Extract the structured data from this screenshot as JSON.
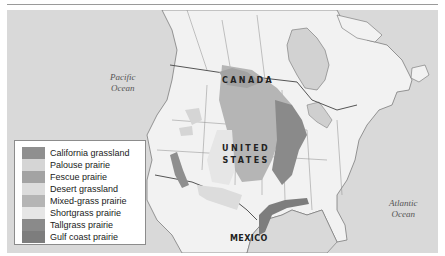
{
  "map": {
    "labels": {
      "pacific": [
        "Pacific",
        "Ocean"
      ],
      "atlantic": [
        "Atlantic",
        "Ocean"
      ],
      "canada": "CANADA",
      "united_states": [
        "UNITED",
        "STATES"
      ],
      "mexico": "MEXICO"
    },
    "colors": {
      "ocean": "#d9d9d9",
      "land": "#f2f2f2",
      "border": "#6e6e6e",
      "lake": "#cfcfcf"
    }
  },
  "legend": {
    "items": [
      {
        "label": "California grassland",
        "color": "#8f8f8f"
      },
      {
        "label": "Palouse prairie",
        "color": "#d5d5d5"
      },
      {
        "label": "Fescue prairie",
        "color": "#a3a3a3"
      },
      {
        "label": "Desert grassland",
        "color": "#dcdcdc"
      },
      {
        "label": "Mixed-grass prairie",
        "color": "#b5b5b5"
      },
      {
        "label": "Shortgrass prairie",
        "color": "#e6e6e6"
      },
      {
        "label": "Tallgrass prairie",
        "color": "#8a8a8a"
      },
      {
        "label": "Gulf coast prairie",
        "color": "#7d7d7d"
      }
    ]
  }
}
